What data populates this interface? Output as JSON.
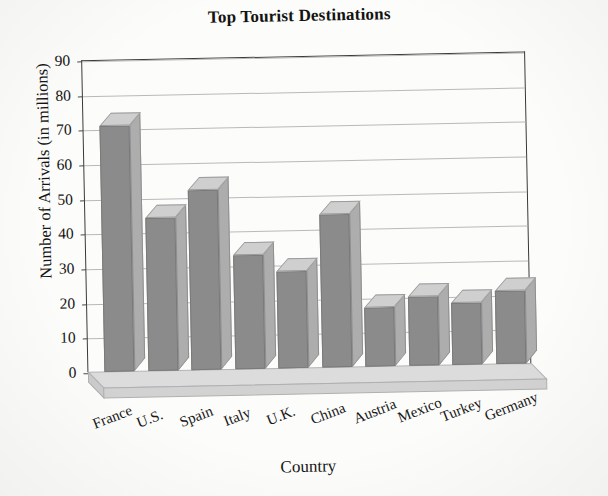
{
  "chart_data": {
    "type": "bar",
    "title": "Top Tourist Destinations",
    "xlabel": "Country",
    "ylabel": "Number of Arrivals (in millions)",
    "categories": [
      "France",
      "U.S.",
      "Spain",
      "Italy",
      "U.K.",
      "China",
      "Austria",
      "Mexico",
      "Turkey",
      "Germany"
    ],
    "values": [
      71,
      44,
      52,
      33,
      28,
      44,
      17,
      20,
      18,
      21
    ],
    "series": [
      {
        "name": "Number of Arrivals (in millions)",
        "values": [
          71,
          44,
          52,
          33,
          28,
          44,
          17,
          20,
          18,
          21
        ]
      }
    ],
    "ylim": [
      0,
      90
    ],
    "yticks": [
      0,
      10,
      20,
      30,
      40,
      50,
      60,
      70,
      80,
      90
    ],
    "ytick_labels": [
      "0",
      "10",
      "20",
      "30",
      "40",
      "50",
      "60",
      "70",
      "80",
      "90"
    ],
    "grid": true,
    "legend": "none",
    "style": "3d-bar",
    "bar_color": "#8b8b8b",
    "bar_top_color": "#cfcfcf",
    "bar_side_color": "#adadad",
    "grid_color": "#b9b9b9",
    "axis_color": "#3a3a3a",
    "background": "#fcfcfa"
  }
}
